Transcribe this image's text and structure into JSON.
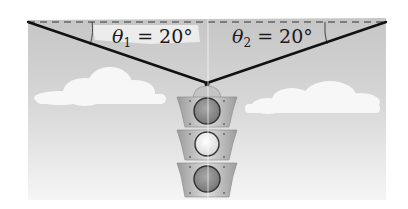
{
  "figure": {
    "type": "physics-statics-diagram",
    "labels": {
      "left_angle": {
        "symbol": "θ",
        "subscript": "1",
        "equals": "=",
        "value": "20°"
      },
      "right_angle": {
        "symbol": "θ",
        "subscript": "2",
        "equals": "=",
        "value": "20°"
      }
    },
    "geometry": {
      "left_anchor": [
        28,
        23
      ],
      "right_anchor": [
        386,
        23
      ],
      "junction": [
        207,
        83
      ],
      "dashed_horizontal_y": 23
    },
    "traffic_light": {
      "lamps": 3
    },
    "colors": {
      "sky_top": "#c9c9c9",
      "sky_bottom": "#f4f4f4",
      "cloud": "#f6f6f6",
      "cable": "#111111",
      "dash": "#333333",
      "housing": "#b8b8b8",
      "lamp_dark": "#8e8e8e",
      "lamp_light": "#ececec"
    }
  }
}
